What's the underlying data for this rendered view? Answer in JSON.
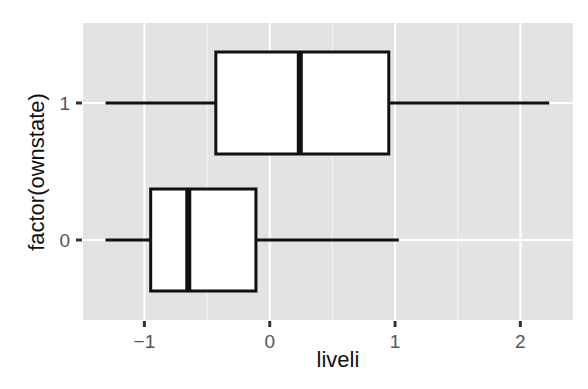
{
  "chart_data": {
    "type": "boxplot",
    "orientation": "horizontal",
    "title": "",
    "xlabel": "liveli",
    "ylabel": "factor(ownstate)",
    "xlim": [
      -1.49,
      2.42
    ],
    "x_ticks": [
      -1,
      0,
      1,
      2
    ],
    "x_tick_labels": [
      "−1",
      "0",
      "1",
      "2"
    ],
    "categories": [
      "0",
      "1"
    ],
    "boxes": [
      {
        "category": "0",
        "whisker_low": -1.31,
        "q1": -0.95,
        "median": -0.65,
        "q3": -0.11,
        "whisker_high": 1.03
      },
      {
        "category": "1",
        "whisker_low": -1.31,
        "q1": -0.43,
        "median": 0.24,
        "q3": 0.95,
        "whisker_high": 2.23
      }
    ],
    "grid": true,
    "legend": null,
    "theme": {
      "panel_background": "#e3e3e3",
      "grid_color": "#ffffff",
      "box_fill": "#ffffff",
      "line_color": "#111111"
    }
  },
  "axes": {
    "x_title": "liveli",
    "y_title": "factor(ownstate)"
  }
}
